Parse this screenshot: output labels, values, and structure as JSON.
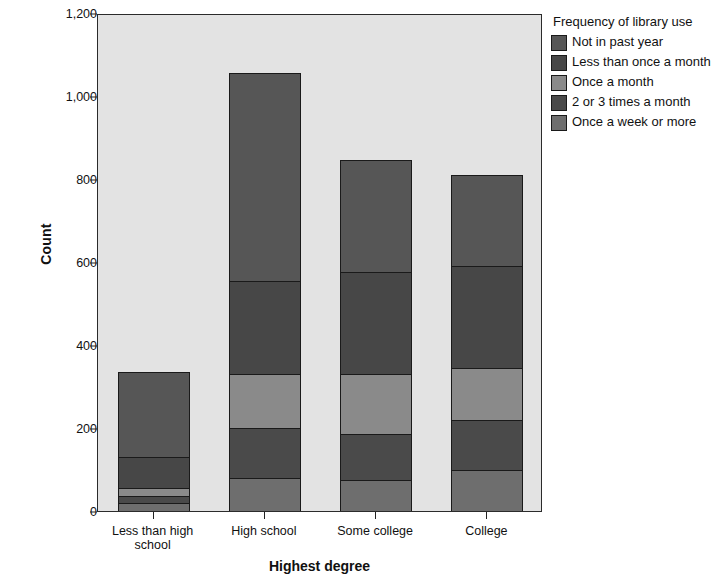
{
  "chart_data": {
    "type": "bar",
    "stacked": true,
    "title": "",
    "xlabel": "Highest degree",
    "ylabel": "Count",
    "categories": [
      "Less than high school",
      "High school",
      "Some college",
      "College"
    ],
    "ylim": [
      0,
      1200
    ],
    "yticks": [
      0,
      200,
      400,
      600,
      800,
      1000,
      1200
    ],
    "ytick_labels": [
      "0",
      "200",
      "400",
      "600",
      "800",
      "1,000",
      "1,200"
    ],
    "grid": false,
    "legend_title": "Frequency of library use",
    "legend_position": "right",
    "series": [
      {
        "name": "Once a week or more",
        "color": "#6e6e6e",
        "values": [
          20,
          80,
          75,
          100
        ]
      },
      {
        "name": "2 or 3 times a month",
        "color": "#4a4a4a",
        "values": [
          15,
          120,
          110,
          120
        ]
      },
      {
        "name": "Once a month",
        "color": "#8a8a8a",
        "values": [
          20,
          130,
          145,
          125
        ]
      },
      {
        "name": "Less than once a month",
        "color": "#474747",
        "values": [
          75,
          225,
          245,
          245
        ]
      },
      {
        "name": "Not in past year",
        "color": "#565656",
        "values": [
          205,
          500,
          270,
          220
        ]
      }
    ],
    "totals": [
      335,
      1055,
      845,
      810
    ]
  },
  "legend": {
    "title": "Frequency of library use",
    "items": [
      {
        "label": "Not in past year",
        "color": "#565656"
      },
      {
        "label": "Less than once a month",
        "color": "#474747"
      },
      {
        "label": "Once a month",
        "color": "#8a8a8a"
      },
      {
        "label": "2 or 3 times a month",
        "color": "#4a4a4a"
      },
      {
        "label": "Once a week or more",
        "color": "#6e6e6e"
      }
    ]
  },
  "axes": {
    "y_title": "Count",
    "x_title": "Highest degree"
  },
  "colors": {
    "plot_background": "#e3e3e3",
    "frame": "#2b2b2b",
    "text": "#111111"
  }
}
